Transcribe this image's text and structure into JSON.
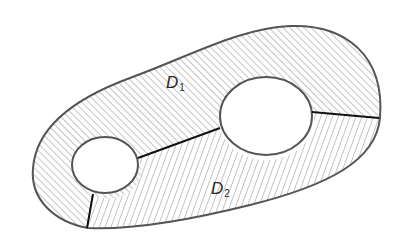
{
  "diagram": {
    "regions": [
      {
        "id": "D1",
        "label": "D",
        "subscript": "1",
        "hatch": "diagonal-45"
      },
      {
        "id": "D2",
        "label": "D",
        "subscript": "2",
        "hatch": "steep-70"
      }
    ],
    "holes": [
      {
        "id": "small-hole",
        "cx": 105,
        "cy": 165,
        "rx": 33,
        "ry": 28
      },
      {
        "id": "large-hole",
        "cx": 266,
        "cy": 116,
        "rx": 46,
        "ry": 39
      }
    ],
    "cuts": [
      {
        "from": [
          138,
          158
        ],
        "to": [
          220,
          128
        ]
      },
      {
        "from": [
          313,
          112
        ],
        "to": [
          378,
          118
        ]
      },
      {
        "from": [
          93,
          195
        ],
        "to": [
          87,
          228
        ]
      }
    ],
    "colors": {
      "outline": "#555555",
      "cut": "#111111",
      "hatch": "#8a8a8a",
      "background": "#ffffff"
    }
  }
}
